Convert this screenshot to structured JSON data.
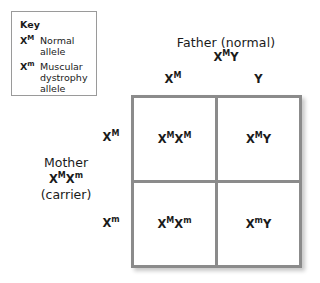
{
  "key": {
    "title": "Key",
    "entries": [
      {
        "symbol_base": "X",
        "symbol_sup": "M",
        "description": "Normal allele"
      },
      {
        "symbol_base": "X",
        "symbol_sup": "m",
        "description": "Muscular dystrophy allele"
      }
    ]
  },
  "father": {
    "title": "Father (normal)",
    "genotype_parts": [
      {
        "base": "X",
        "sup": "M"
      },
      {
        "base": "Y",
        "sup": ""
      }
    ]
  },
  "mother": {
    "title": "Mother",
    "status": "(carrier)",
    "genotype_parts": [
      {
        "base": "X",
        "sup": "M"
      },
      {
        "base": "X",
        "sup": "m"
      }
    ]
  },
  "grid": {
    "column_headers": [
      {
        "base": "X",
        "sup": "M"
      },
      {
        "base": "Y",
        "sup": ""
      }
    ],
    "row_headers": [
      {
        "base": "X",
        "sup": "M"
      },
      {
        "base": "X",
        "sup": "m"
      }
    ],
    "cells": [
      {
        "row": 0,
        "col": 0,
        "parts": [
          {
            "base": "X",
            "sup": "M"
          },
          {
            "base": "X",
            "sup": "M"
          }
        ]
      },
      {
        "row": 0,
        "col": 1,
        "parts": [
          {
            "base": "X",
            "sup": "M"
          },
          {
            "base": "Y",
            "sup": ""
          }
        ]
      },
      {
        "row": 1,
        "col": 0,
        "parts": [
          {
            "base": "X",
            "sup": "M"
          },
          {
            "base": "X",
            "sup": "m"
          }
        ]
      },
      {
        "row": 1,
        "col": 1,
        "parts": [
          {
            "base": "X",
            "sup": "m"
          },
          {
            "base": "Y",
            "sup": ""
          }
        ]
      }
    ]
  },
  "colors": {
    "grid_line": "#8b8b8b",
    "key_border": "#9a9a9a",
    "text": "#1a1a1a",
    "background": "#ffffff"
  }
}
